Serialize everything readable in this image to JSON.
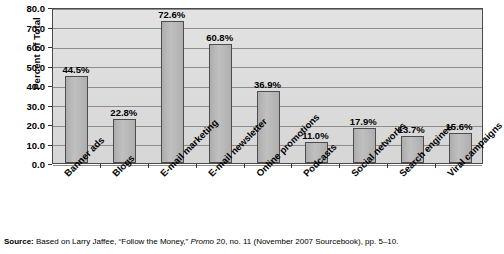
{
  "chart_data": {
    "type": "bar",
    "title": "",
    "subtitle": "",
    "xlabel": "",
    "ylabel": "Percent of Total",
    "ylim": [
      0,
      80
    ],
    "ytick_step": 10,
    "grid": true,
    "legend": "none",
    "orientation": "vertical",
    "value_label_format": "percent-one-decimal",
    "categories": [
      "Banner ads",
      "Blogs",
      "E-mail marketing",
      "E-mail newsletter",
      "Online promotions",
      "Podcasts",
      "Social networks",
      "Search engines",
      "Viral campaigns"
    ],
    "values": [
      44.5,
      22.8,
      72.6,
      60.8,
      36.9,
      11.0,
      17.9,
      13.7,
      15.6
    ],
    "value_labels": [
      "44.5%",
      "22.8%",
      "72.6%",
      "60.8%",
      "36.9%",
      "11.0%",
      "17.9%",
      "13.7%",
      "15.6%"
    ],
    "ytick_labels": [
      "0.0",
      "10.0",
      "20.0",
      "30.0",
      "40.0",
      "50.0",
      "60.0",
      "70.0",
      "80.0"
    ],
    "colors": {
      "bar_fill": "#b8b8b8",
      "bar_edge": "#4d4d4d",
      "plot_background": "#dedede",
      "gridline": "#8d8d8d",
      "frame": "#4a4a4a",
      "text": "#000000",
      "page_background": "#ffffff"
    }
  },
  "source": {
    "lead": "Source:",
    "text_before_italic": " Based on Larry Jaffee, “Follow the Money,” ",
    "italic": "Promo",
    "text_after_italic": " 20, no. 11 (November 2007 Sourcebook), pp. 5–10."
  }
}
